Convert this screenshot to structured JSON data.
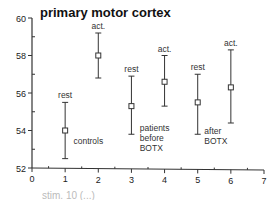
{
  "chart_data": {
    "type": "scatter",
    "title": "primary motor cortex",
    "xlabel": "",
    "ylabel": "",
    "xlim": [
      0,
      7
    ],
    "ylim": [
      52,
      60
    ],
    "x_ticks": [
      0,
      1,
      2,
      3,
      4,
      5,
      6,
      7
    ],
    "y_ticks": [
      52,
      54,
      56,
      58,
      60
    ],
    "grid": false,
    "points": [
      {
        "x": 1,
        "y": 54.0,
        "err_low": 52.5,
        "err_high": 55.5,
        "label": "rest"
      },
      {
        "x": 2,
        "y": 58.0,
        "err_low": 56.8,
        "err_high": 59.2,
        "label": "act."
      },
      {
        "x": 3,
        "y": 55.3,
        "err_low": 53.8,
        "err_high": 56.9,
        "label": "rest"
      },
      {
        "x": 4,
        "y": 56.6,
        "err_low": 55.3,
        "err_high": 58.0,
        "label": "act."
      },
      {
        "x": 5,
        "y": 55.5,
        "err_low": 53.8,
        "err_high": 57.0,
        "label": "rest"
      },
      {
        "x": 6,
        "y": 56.3,
        "err_low": 54.4,
        "err_high": 58.3,
        "label": "act."
      }
    ],
    "annotations": [
      {
        "text": "controls",
        "x": 1.25,
        "y": 53.3
      },
      {
        "text": "patients\nbefore\nBOTX",
        "x": 3.25,
        "y": 54.0
      },
      {
        "text": "after\nBOTX",
        "x": 5.2,
        "y": 53.8
      }
    ],
    "footer": "stim. 10 (...)"
  }
}
